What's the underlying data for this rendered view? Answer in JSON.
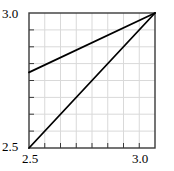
{
  "chart_data": {
    "type": "line",
    "title": "",
    "xlabel": "",
    "ylabel": "",
    "xlim": [
      2.5,
      3.0
    ],
    "ylim": [
      2.5,
      3.0
    ],
    "grid": true,
    "legend": "none",
    "x_tick_labels": [
      "2.5",
      "3.0"
    ],
    "y_tick_labels": [
      "2.5",
      "3.0"
    ],
    "x_major_ticks": [
      2.5,
      3.0
    ],
    "y_major_ticks": [
      2.5,
      3.0
    ],
    "x_minor_tick_count": 8,
    "y_minor_tick_count": 8,
    "series": [
      {
        "name": "upper-line",
        "x": [
          2.5,
          3.0
        ],
        "y": [
          2.78,
          3.0
        ],
        "color": "#000000"
      },
      {
        "name": "lower-line",
        "x": [
          2.5,
          3.0
        ],
        "y": [
          2.5,
          3.0
        ],
        "color": "#000000"
      }
    ]
  },
  "axes": {
    "y_max_label": "3.0",
    "y_min_label": "2.5",
    "x_min_label": "2.5",
    "x_max_label": "3.0"
  },
  "colors": {
    "line": "#000000",
    "frame": "#3a3a3a",
    "grid": "#d9d9d9",
    "background": "#ffffff"
  }
}
